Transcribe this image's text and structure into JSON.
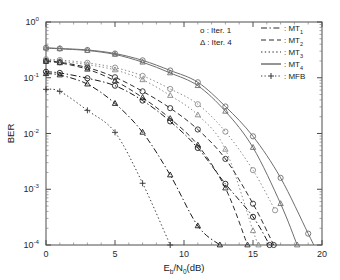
{
  "chart_data": {
    "type": "line",
    "title": "",
    "xlabel": "E_b/N_0(dB)",
    "xlabel_parts": {
      "lead": "E",
      "sub1": "b",
      "mid": "/N",
      "sub2": "0",
      "tail": "(dB)"
    },
    "ylabel": "BER",
    "xlim": [
      0,
      20
    ],
    "ylim": [
      0.0001,
      1
    ],
    "yscale": "log",
    "xscale": "linear",
    "grid": false,
    "xticks": [
      0,
      5,
      10,
      15,
      20
    ],
    "xticklabels": [
      "0",
      "5",
      "10",
      "15",
      "20"
    ],
    "yticks": [
      1,
      0.1,
      0.01,
      0.001,
      0.0001
    ],
    "yticklabels": [
      "10^0",
      "10^-1",
      "10^-2",
      "10^-3",
      "10^-4"
    ],
    "ytick_mantissa": "10",
    "ytick_exponents": [
      "0",
      "-1",
      "-2",
      "-3",
      "-4"
    ],
    "legend_position": "upper right inside",
    "marker_legend": [
      {
        "symbol": "o",
        "label": "o : Iter. 1",
        "sep": ":",
        "name": "Iter. 1"
      },
      {
        "symbol": "triangle",
        "label": "Δ : Iter. 4",
        "sep": ":",
        "name": "Iter. 4"
      }
    ],
    "style_legend": [
      {
        "style": "dashdot",
        "label": "MT",
        "subscript": "1",
        "prefix": ": "
      },
      {
        "style": "dashed",
        "label": "MT",
        "subscript": "2",
        "prefix": ": "
      },
      {
        "style": "dotted",
        "label": "MT",
        "subscript": "3",
        "prefix": ": "
      },
      {
        "style": "solid",
        "label": "MT",
        "subscript": "4",
        "prefix": ": "
      },
      {
        "style": "dashdot-plus",
        "label": "MFB",
        "subscript": "",
        "prefix": ": "
      }
    ],
    "series": [
      {
        "name": "MT4 Iter. 1",
        "style": "solid",
        "marker": "o",
        "color": "#6e6e6e",
        "x": [
          0,
          1,
          3,
          5,
          7,
          9,
          11,
          13,
          15,
          17,
          19,
          20
        ],
        "y": [
          0.345,
          0.335,
          0.315,
          0.272,
          0.205,
          0.135,
          0.083,
          0.0305,
          0.0089,
          0.0016,
          0.00016,
          5e-05
        ]
      },
      {
        "name": "MT4 Iter. 4",
        "style": "solid",
        "marker": "triangle",
        "color": "#6e6e6e",
        "x": [
          0,
          1,
          3,
          5,
          7,
          9,
          11,
          13,
          15,
          17,
          18.2
        ],
        "y": [
          0.34,
          0.33,
          0.308,
          0.262,
          0.19,
          0.122,
          0.072,
          0.025,
          0.0056,
          0.00055,
          0.0001
        ]
      },
      {
        "name": "MT3 Iter. 1",
        "style": "dotted",
        "marker": "o",
        "color": "#8a8a8a",
        "x": [
          0,
          1,
          3,
          5,
          7,
          9,
          11,
          13,
          15,
          16.6
        ],
        "y": [
          0.215,
          0.208,
          0.185,
          0.152,
          0.108,
          0.063,
          0.0335,
          0.0108,
          0.0022,
          0.00042
        ]
      },
      {
        "name": "MT3 Iter. 4",
        "style": "dotted",
        "marker": "triangle",
        "color": "#8a8a8a",
        "x": [
          0,
          1,
          3,
          5,
          7,
          9,
          11,
          13,
          15,
          15.4
        ],
        "y": [
          0.205,
          0.197,
          0.172,
          0.138,
          0.092,
          0.048,
          0.0215,
          0.0052,
          0.00018,
          0.0001
        ]
      },
      {
        "name": "MT2 Iter. 1",
        "style": "dashed",
        "marker": "o",
        "color": "#2e2e2e",
        "x": [
          0,
          1,
          3,
          5,
          7,
          9,
          11,
          13,
          15,
          16.5
        ],
        "y": [
          0.2,
          0.19,
          0.152,
          0.102,
          0.057,
          0.0285,
          0.0118,
          0.0035,
          0.00055,
          0.0001
        ]
      },
      {
        "name": "MT2 Iter. 4",
        "style": "dashed",
        "marker": "triangle",
        "color": "#2e2e2e",
        "x": [
          0,
          1,
          3,
          5,
          7,
          9,
          11,
          13,
          14.6
        ],
        "y": [
          0.195,
          0.185,
          0.142,
          0.088,
          0.044,
          0.0185,
          0.0062,
          0.00105,
          0.0001
        ]
      },
      {
        "name": "MT1 Iter. 1",
        "style": "dashdot",
        "marker": "o",
        "color": "#1a1a1a",
        "x": [
          0,
          1,
          3,
          5,
          7,
          9,
          11,
          13,
          15,
          16.2
        ],
        "y": [
          0.128,
          0.122,
          0.098,
          0.072,
          0.039,
          0.0165,
          0.0055,
          0.00125,
          0.00032,
          0.0001
        ]
      },
      {
        "name": "MT1 Iter. 4",
        "style": "dashdot",
        "marker": "triangle",
        "color": "#1a1a1a",
        "x": [
          0,
          1,
          3,
          5,
          7,
          9,
          11,
          12.6
        ],
        "y": [
          0.118,
          0.112,
          0.077,
          0.0345,
          0.0105,
          0.0018,
          0.00022,
          0.0001
        ]
      },
      {
        "name": "MFB",
        "style": "dotted",
        "marker": "plus",
        "color": "#3a3a3a",
        "x": [
          0,
          1,
          3,
          5,
          7,
          9
        ],
        "y": [
          0.062,
          0.057,
          0.026,
          0.0105,
          0.00128,
          0.0001
        ]
      }
    ],
    "annotations": []
  }
}
